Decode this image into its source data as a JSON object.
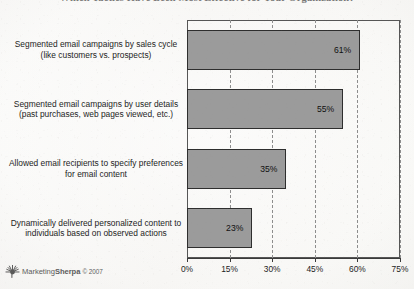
{
  "chart_data": {
    "type": "bar",
    "orientation": "horizontal",
    "title": "Which Tactics Have Been Most Effective for Your Organization?",
    "xlabel": "",
    "ylabel": "",
    "xlim": [
      0,
      75
    ],
    "xticks": [
      "0%",
      "15%",
      "30%",
      "45%",
      "60%",
      "75%"
    ],
    "xtick_values": [
      0,
      15,
      30,
      45,
      60,
      75
    ],
    "grid": "vertical-dashed",
    "legend": "none",
    "bar_color": "#9b9b9b",
    "bar_border_color": "#2e2e2e",
    "categories": [
      "Segmented email campaigns by sales cycle (like customers vs. prospects)",
      "Segmented email campaigns by user details (past purchases, web pages viewed, etc.)",
      "Allowed email recipients to specify preferences for email content",
      "Dynamically delivered personalized content to individuals based on observed actions"
    ],
    "values": [
      61,
      55,
      35,
      23
    ],
    "data_labels": [
      "61%",
      "55%",
      "35%",
      "23%"
    ]
  },
  "source": {
    "logo_icon": "sunburst-icon",
    "brand_prefix": "Marketing",
    "brand_suffix": "Sherpa",
    "copyright": "© 2007"
  }
}
